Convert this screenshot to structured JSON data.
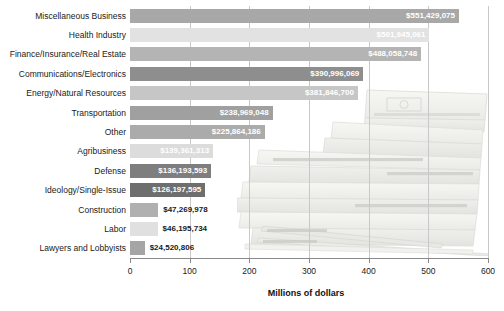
{
  "chart_data": {
    "type": "bar",
    "orientation": "horizontal",
    "title": "",
    "xlabel": "Millions of dollars",
    "ylabel": "",
    "xlim": [
      0,
      600
    ],
    "xticks": [
      0,
      100,
      200,
      300,
      400,
      500,
      600
    ],
    "grid": true,
    "legend": false,
    "background_image": "stacked-money-bundles-photo",
    "value_unit": "USD",
    "categories": [
      "Miscellaneous Business",
      "Health Industry",
      "Finance/Insurance/Real Estate",
      "Communications/Electronics",
      "Energy/Natural Resources",
      "Transportation",
      "Other",
      "Agribusiness",
      "Defense",
      "Ideology/Single-Issue",
      "Construction",
      "Labor",
      "Lawyers and Lobbyists"
    ],
    "values": [
      551.429075,
      501.945061,
      488.058748,
      390.996069,
      381.8467,
      238.969048,
      225.864186,
      139.361313,
      136.193593,
      126.197595,
      47.269978,
      46.195734,
      24.520806
    ],
    "value_labels": [
      "$551,429,075",
      "$501,945,061",
      "$488,058,748",
      "$390,996,069",
      "$381,846,700",
      "$238,969,048",
      "$225,864,186",
      "$139,361,313",
      "$136,193,593",
      "$126,197,595",
      "$47,269,978",
      "$46,195,734",
      "$24,520,806"
    ],
    "bar_colors": [
      "#a8a8a8",
      "#e2e2e2",
      "#b4b4b4",
      "#8e8e8e",
      "#c6c6c6",
      "#a0a0a0",
      "#ababab",
      "#dcdcdc",
      "#7e7e7e",
      "#6e6e6e",
      "#b0b0b0",
      "#e0e0e0",
      "#a5a5a5"
    ],
    "label_placement": [
      "inside",
      "inside",
      "inside",
      "inside",
      "inside",
      "inside",
      "inside",
      "inside",
      "inside",
      "inside",
      "outside",
      "outside",
      "outside"
    ]
  },
  "axis": {
    "tick_labels": [
      "0",
      "100",
      "200",
      "300",
      "400",
      "500",
      "600"
    ],
    "title": "Millions of dollars"
  }
}
